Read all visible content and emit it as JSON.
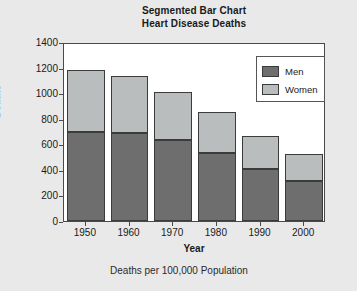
{
  "chart_data": {
    "type": "bar",
    "stacked": true,
    "title": "Segmented Bar Chart",
    "subtitle": "Heart Disease Deaths",
    "footnote": "Deaths per 100,000 Population",
    "xlabel": "Year",
    "ylabel": "Deaths",
    "categories": [
      "1950",
      "1960",
      "1970",
      "1980",
      "1990",
      "2000"
    ],
    "series": [
      {
        "name": "Men",
        "color": "#6e6e6e",
        "values": [
          700,
          685,
          635,
          535,
          410,
          315
        ]
      },
      {
        "name": "Women",
        "color": "#b9bdbd",
        "values": [
          480,
          450,
          375,
          320,
          255,
          210
        ]
      }
    ],
    "totals": [
      1180,
      1135,
      1010,
      855,
      665,
      525
    ],
    "ylim": [
      0,
      1400
    ],
    "yticks": [
      0,
      200,
      400,
      600,
      800,
      1000,
      1200,
      1400
    ],
    "ytick_labels": [
      "0",
      "200",
      "400",
      "600",
      "800",
      "1000",
      "1200",
      "1400"
    ],
    "grid": false,
    "legend_position": "top-right",
    "plot_background": "#ffffff",
    "figure_background": "#e9e9e9",
    "axis_color": "#4a4a4a",
    "bar_edge_color": "#3b3b3b"
  },
  "legend": {
    "entries": [
      {
        "label": "Men"
      },
      {
        "label": "Women"
      }
    ]
  }
}
